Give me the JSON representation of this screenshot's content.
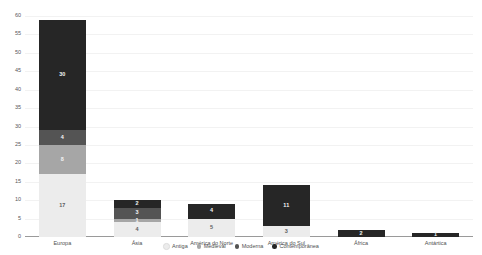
{
  "chart_data": {
    "type": "bar",
    "stacked": true,
    "title": "",
    "xlabel": "",
    "ylabel": "",
    "ylim": [
      0,
      60
    ],
    "yticks": [
      0,
      5,
      10,
      15,
      20,
      25,
      30,
      35,
      40,
      45,
      50,
      55,
      60
    ],
    "grid": true,
    "legend_position": "bottom",
    "categories": [
      "Europa",
      "Ásia",
      "América do Norte",
      "América do Sul",
      "África",
      "Antártica"
    ],
    "series": [
      {
        "name": "Antiga",
        "color": "#ececec",
        "values": [
          17,
          4,
          5,
          3,
          0,
          0
        ]
      },
      {
        "name": "Medieval",
        "color": "#a6a6a6",
        "values": [
          8,
          1,
          0,
          0,
          0,
          0
        ]
      },
      {
        "name": "Moderna",
        "color": "#545454",
        "values": [
          4,
          3,
          0,
          0,
          0,
          0
        ]
      },
      {
        "name": "Contemporânea",
        "color": "#262626",
        "values": [
          30,
          2,
          4,
          11,
          2,
          1
        ]
      }
    ],
    "totals": [
      59,
      10,
      9,
      14,
      2,
      1
    ]
  },
  "axis": {
    "y_tick_labels": [
      "0",
      "5",
      "10",
      "15",
      "20",
      "25",
      "30",
      "35",
      "40",
      "45",
      "50",
      "55",
      "60"
    ]
  },
  "legend": {
    "items": [
      {
        "label": "Antiga",
        "color": "#ececec"
      },
      {
        "label": "Medieval",
        "color": "#a6a6a6"
      },
      {
        "label": "Moderna",
        "color": "#545454"
      },
      {
        "label": "Contemporânea",
        "color": "#262626"
      }
    ]
  },
  "colors": {
    "baseline": "#9a9a9a",
    "gridline": "#f2f2f2",
    "background": "#ffffff",
    "tick_text": "#57585a"
  }
}
